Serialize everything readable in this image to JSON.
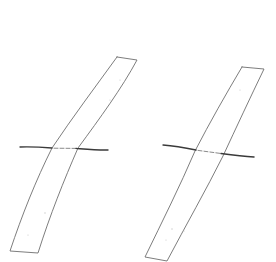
{
  "drawing": {
    "description": "Pencil sketch of two slanted rectangular strips, each crossed by a horizontal stroke",
    "background_color": "#ffffff",
    "line_color": "#6e6e6e",
    "stroke_color": "#3a3a3a",
    "figures": [
      {
        "id": "left",
        "strip": {
          "top_left": [
            117,
            57
          ],
          "top_right": [
            137,
            60
          ],
          "right_mid": [
            78,
            148
          ],
          "bottom_right": [
            38,
            253
          ],
          "bottom_left": [
            10,
            251
          ],
          "left_mid": [
            52,
            148
          ]
        },
        "crossbar": {
          "start": [
            20,
            147
          ],
          "end": [
            108,
            150
          ]
        }
      },
      {
        "id": "right",
        "strip": {
          "top_left": [
            242,
            67
          ],
          "top_right": [
            264,
            69
          ],
          "right_mid": [
            223,
            156
          ],
          "bottom_right": [
            167,
            261
          ],
          "bottom_left": [
            145,
            257
          ],
          "left_mid": [
            195,
            151
          ]
        },
        "crossbar": {
          "start": [
            163,
            145
          ],
          "end": [
            254,
            157
          ]
        }
      }
    ]
  }
}
